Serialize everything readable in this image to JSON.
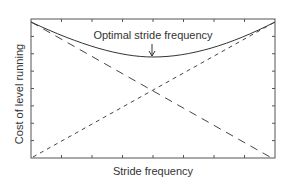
{
  "chart_data": {
    "type": "line",
    "title": "",
    "xlabel": "Stride frequency",
    "ylabel": "Cost of level running",
    "xlim": [
      0,
      1
    ],
    "ylim": [
      0,
      1
    ],
    "grid": false,
    "legend": null,
    "x_ticks": 8,
    "y_ticks": 8,
    "series": [
      {
        "name": "Total cost",
        "style": "solid",
        "x": [
          0,
          0.25,
          0.5,
          0.75,
          1
        ],
        "y": [
          0.98,
          0.85,
          0.73,
          0.8,
          0.98
        ]
      },
      {
        "name": "Decreasing component",
        "style": "long-dash",
        "x": [
          0,
          0.5,
          0.97
        ],
        "y": [
          0.98,
          0.37,
          0.01
        ]
      },
      {
        "name": "Increasing component",
        "style": "short-dash",
        "x": [
          0.01,
          0.5,
          1
        ],
        "y": [
          0.01,
          0.37,
          0.98
        ]
      }
    ],
    "annotations": [
      {
        "text": "Optimal stride frequency",
        "x": 0.5,
        "y": 0.73,
        "arrow": "down"
      }
    ]
  },
  "labels": {
    "x": "Stride frequency",
    "y": "Cost of level running",
    "annotation": "Optimal stride frequency"
  },
  "colors": {
    "axis": "#555555",
    "line": "#333333"
  }
}
